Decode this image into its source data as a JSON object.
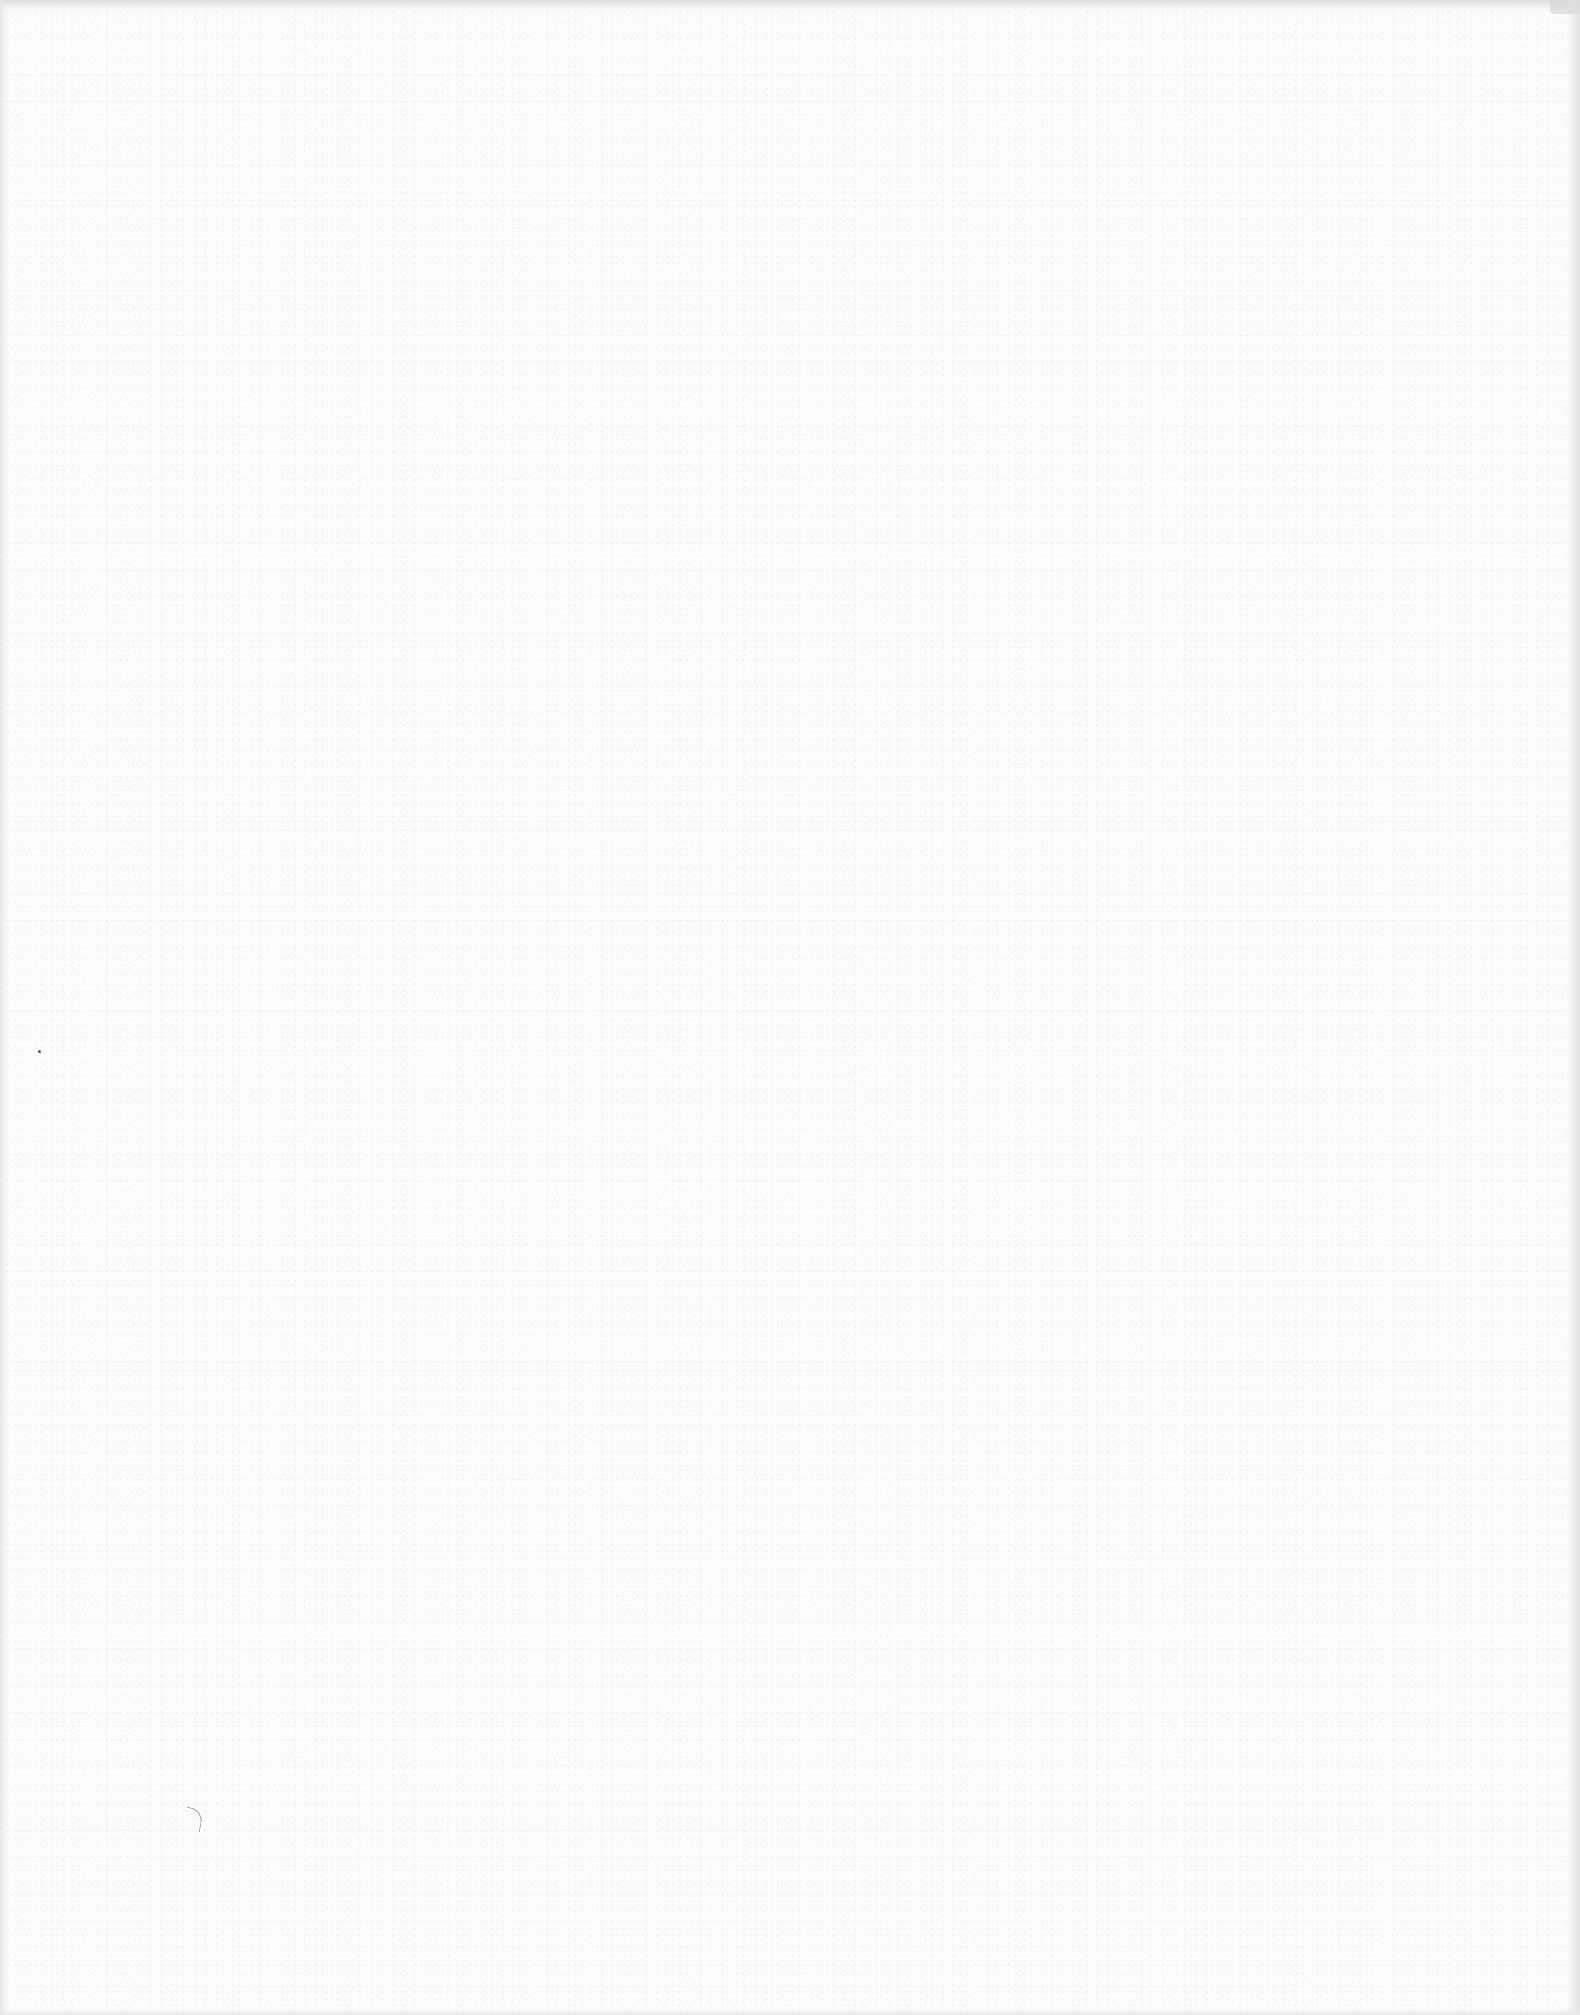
{
  "page": {
    "type": "blank scanned sheet",
    "text_content": [],
    "colors": {
      "paper": "#fcfcfc",
      "top_edge_shadow": "#dcdcdc",
      "side_edge_shadow": "#e4e4e4",
      "speck": "#555555",
      "mark": "#9a9a9a"
    },
    "artifacts": [
      {
        "kind": "speck",
        "x": 38,
        "y": 1050
      },
      {
        "kind": "curve-mark",
        "x": 185,
        "y": 1808
      }
    ]
  }
}
